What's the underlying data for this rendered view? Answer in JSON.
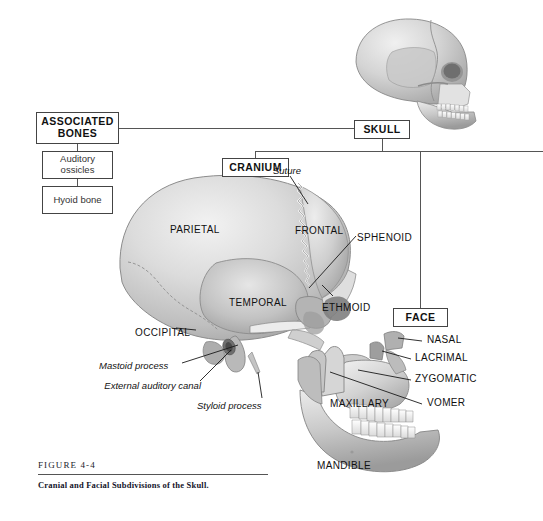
{
  "figure": {
    "number": "FIGURE 4-4",
    "caption": "Cranial and Facial Subdivisions of the Skull.",
    "background": "#ffffff",
    "line_color": "#555555",
    "box_border": "#444444"
  },
  "flowchart": {
    "boxes": [
      {
        "id": "skull",
        "label": "SKULL",
        "style": "bold",
        "x": 354,
        "y": 120,
        "w": 56,
        "h": 19
      },
      {
        "id": "associated-bones",
        "label": "ASSOCIATED BONES",
        "style": "bold",
        "x": 36,
        "y": 112,
        "w": 83,
        "h": 32
      },
      {
        "id": "auditory-ossicles",
        "label": "Auditory ossicles",
        "style": "plain",
        "x": 42,
        "y": 151,
        "w": 71,
        "h": 28
      },
      {
        "id": "hyoid-bone",
        "label": "Hyoid bone",
        "style": "plain",
        "x": 42,
        "y": 186,
        "w": 71,
        "h": 28
      },
      {
        "id": "cranium",
        "label": "CRANIUM",
        "style": "bold",
        "x": 222,
        "y": 158,
        "w": 67,
        "h": 19
      },
      {
        "id": "face",
        "label": "FACE",
        "style": "bold",
        "x": 393,
        "y": 308,
        "w": 55,
        "h": 19
      }
    ]
  },
  "anatomy_labels": {
    "cranium_bones": [
      {
        "name": "PARIETAL",
        "x": 170,
        "y": 224
      },
      {
        "name": "FRONTAL",
        "x": 295,
        "y": 225
      },
      {
        "name": "SPHENOID",
        "x": 357,
        "y": 232
      },
      {
        "name": "TEMPORAL",
        "x": 229,
        "y": 297
      },
      {
        "name": "ETHMOID",
        "x": 322,
        "y": 302
      },
      {
        "name": "OCCIPITAL",
        "x": 135,
        "y": 327
      }
    ],
    "face_bones": [
      {
        "name": "NASAL",
        "x": 427,
        "y": 339
      },
      {
        "name": "LACRIMAL",
        "x": 415,
        "y": 357
      },
      {
        "name": "ZYGOMATIC",
        "x": 415,
        "y": 378
      },
      {
        "name": "VOMER",
        "x": 427,
        "y": 402
      },
      {
        "name": "MAXILLARY",
        "x": 330,
        "y": 403
      },
      {
        "name": "MANDIBLE",
        "x": 317,
        "y": 465
      }
    ],
    "features": [
      {
        "name": "Suture",
        "x": 273,
        "y": 170,
        "align": "left"
      },
      {
        "name": "Mastoid process",
        "x": 99,
        "y": 366,
        "align": "left"
      },
      {
        "name": "External auditory canal",
        "x": 112,
        "y": 388,
        "align": "right"
      },
      {
        "name": "Styloid process",
        "x": 197,
        "y": 406,
        "align": "left"
      }
    ]
  },
  "artwork": {
    "views": [
      {
        "id": "lateral-skull-small",
        "description": "small lateral view of whole skull, top right"
      },
      {
        "id": "cranium-lateral",
        "description": "large lateral view of the cranium"
      },
      {
        "id": "facial-bones",
        "description": "lateral view of the facial bones with mandible"
      }
    ]
  }
}
